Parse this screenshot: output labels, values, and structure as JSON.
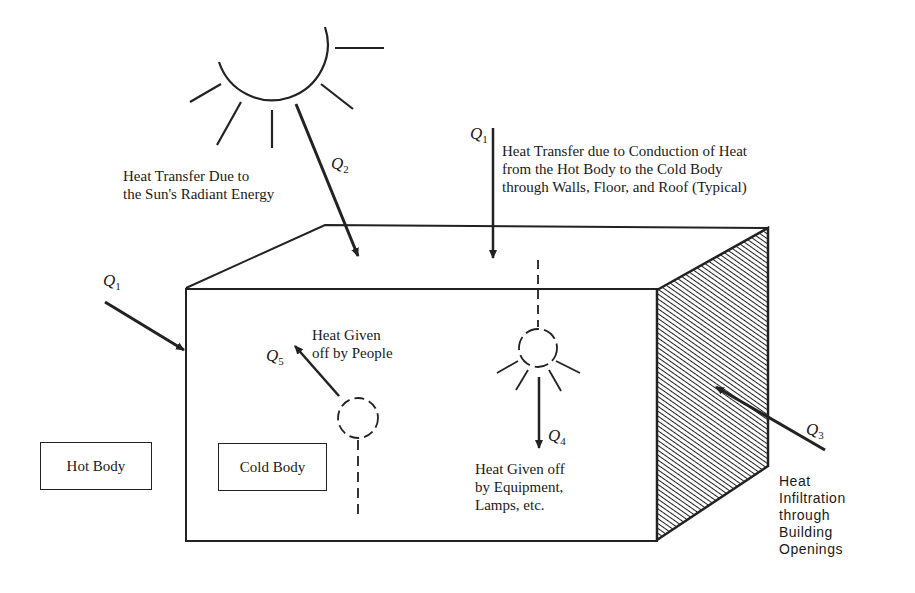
{
  "diagram": {
    "type": "heat-transfer-building-illustration",
    "stroke_color": "#222222",
    "background": "#ffffff"
  },
  "labels": {
    "q2_text": "Heat Transfer Due to\nthe Sun's Radiant Energy",
    "q1_top_text": "Heat Transfer due to Conduction of Heat\nfrom the Hot Body to the Cold Body\nthrough Walls, Floor, and Roof (Typical)",
    "q5_text": "Heat Given\noff by People",
    "q4_text": "Heat Given off\nby Equipment,\nLamps, etc.",
    "q3_text": "Heat\nInfiltration\nthrough\nBuilding\nOpenings",
    "hot_body": "Hot Body",
    "cold_body": "Cold Body"
  },
  "symbols": {
    "q1_left": {
      "base": "Q",
      "sub": "1"
    },
    "q1_top": {
      "base": "Q",
      "sub": "1"
    },
    "q2": {
      "base": "Q",
      "sub": "2"
    },
    "q3": {
      "base": "Q",
      "sub": "3"
    },
    "q4": {
      "base": "Q",
      "sub": "4"
    },
    "q5": {
      "base": "Q",
      "sub": "5"
    }
  },
  "icons": [
    "sun-icon",
    "person-icon",
    "lamp-icon",
    "hatched-wall-openings"
  ]
}
